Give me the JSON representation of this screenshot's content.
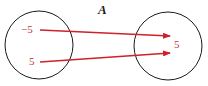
{
  "title": "A",
  "domain_set": {
    "elements": [
      "−5",
      "5"
    ]
  },
  "codomain_set": {
    "elements": [
      "5"
    ]
  },
  "mappings": [
    {
      "from": "−5",
      "to": "5"
    },
    {
      "from": "5",
      "to": "5"
    }
  ],
  "colors": {
    "arrow": "#d0202a",
    "label": "#c0393b",
    "circle": "#1a1a1a"
  }
}
